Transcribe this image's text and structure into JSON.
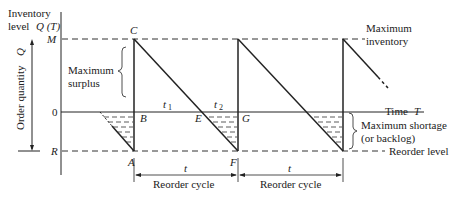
{
  "axes": {
    "y_label_line1": "Inventory",
    "y_label_line2": "level",
    "y_label_symbol": "Q (T)",
    "x_label": "Time",
    "x_label_symbol": "T",
    "order_quantity_label": "Order quantity",
    "order_quantity_symbol": "Q"
  },
  "levels": {
    "M": "M",
    "zero": "0",
    "R": "R"
  },
  "points": {
    "A": "A",
    "B": "B",
    "C": "C",
    "E": "E",
    "F": "F",
    "G": "G"
  },
  "times": {
    "t1": "t",
    "t1_sub": "1",
    "t2": "t",
    "t2_sub": "2",
    "t": "t"
  },
  "annotations": {
    "max_surplus_1": "Maximum",
    "max_surplus_2": "surplus",
    "max_inventory_1": "Maximum",
    "max_inventory_2": "inventory",
    "max_shortage_1": "Maximum shortage",
    "max_shortage_2": "(or backlog)",
    "reorder_level": "Reorder level",
    "reorder_cycle_1": "Reorder cycle",
    "reorder_cycle_2": "Reorder cycle"
  },
  "colors": {
    "line": "#1a1a1a",
    "dash": "#333333",
    "background": "#ffffff"
  }
}
